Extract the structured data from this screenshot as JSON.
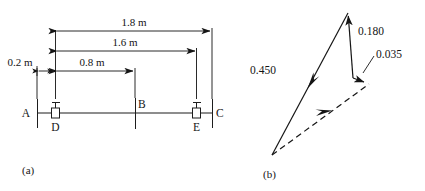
{
  "figure": {
    "panels": [
      {
        "id": "a",
        "label": "(a)",
        "caption_x": 22,
        "caption_y": 174
      },
      {
        "id": "b",
        "label": "(b)",
        "caption_x": 263,
        "caption_y": 178
      }
    ]
  },
  "beam_diagram": {
    "title": "beam with supports and dimensions",
    "node_labels": [
      {
        "name": "A",
        "text": "A",
        "x": 25,
        "y": 114
      },
      {
        "name": "B",
        "text": "B",
        "x": 138,
        "y": 106
      },
      {
        "name": "C",
        "text": "C",
        "x": 216,
        "y": 114
      },
      {
        "name": "D",
        "text": "D",
        "x": 51,
        "y": 128
      },
      {
        "name": "E",
        "text": "E",
        "x": 192,
        "y": 128
      }
    ],
    "dimensions": [
      {
        "name": "overall-span",
        "text": "1.8 m",
        "value": 1.8,
        "unit": "m",
        "from": "A",
        "to": "C",
        "label_x": 134,
        "label_y": 22
      },
      {
        "name": "a-to-e",
        "text": "1.6 m",
        "value": 1.6,
        "unit": "m",
        "from": "A",
        "to": "E",
        "label_x": 125,
        "label_y": 53
      },
      {
        "name": "d-to-b",
        "text": "0.8 m",
        "value": 0.8,
        "unit": "m",
        "from": "D",
        "to": "B",
        "label_x": 91,
        "label_y": 76
      },
      {
        "name": "a-to-d",
        "text": "0.2 m",
        "value": 0.2,
        "unit": "m",
        "from": "A",
        "to": "D",
        "label_x": 20,
        "label_y": 70
      }
    ]
  },
  "vector_diagram": {
    "title": "force triangle",
    "vectors": [
      {
        "name": "vector-0-450",
        "text": "0.450",
        "value": 0.45,
        "label_x": 248,
        "label_y": 72,
        "style": "solid"
      },
      {
        "name": "vector-0-180",
        "text": "0.180",
        "value": 0.18,
        "label_x": 358,
        "label_y": 32,
        "style": "solid"
      },
      {
        "name": "vector-0-035",
        "text": "0.035",
        "value": 0.035,
        "label_x": 378,
        "label_y": 60,
        "style": "solid"
      },
      {
        "name": "resultant",
        "text": "",
        "value": null,
        "label_x": 0,
        "label_y": 0,
        "style": "dashed"
      }
    ]
  },
  "colors": {
    "ink": "#151515",
    "background": "#ffffff"
  }
}
